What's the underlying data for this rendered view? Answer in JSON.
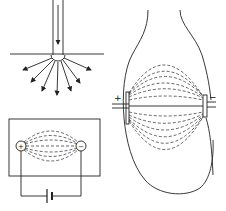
{
  "figure": {
    "panels": [
      {
        "id": "point-electrode",
        "description": "Current entering surface through single electrode, spreading radially"
      },
      {
        "id": "bipolar-field",
        "description": "Field lines between two electrodes in a conducting medium connected to a battery"
      },
      {
        "id": "limb-field",
        "description": "Current field lines through a limb between two electrodes"
      }
    ],
    "labels": {
      "plus_small": "+",
      "minus_small": "−",
      "plus_large": "+",
      "minus_large": "−"
    },
    "colors": {
      "line": "#222222",
      "background": "#ffffff"
    }
  }
}
